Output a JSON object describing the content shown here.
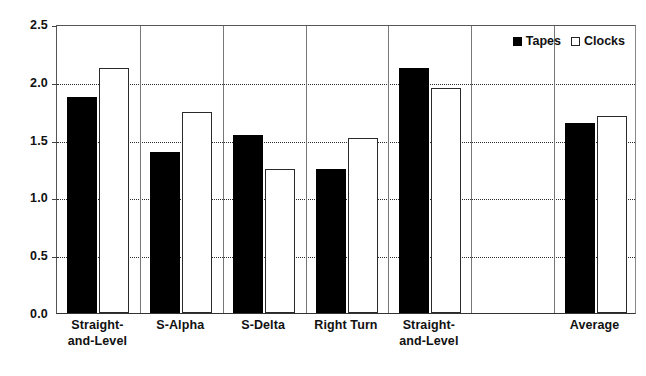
{
  "chart_data": {
    "type": "bar",
    "title": "",
    "subtitle": "",
    "xlabel": "",
    "ylabel": "",
    "ylim": [
      0.0,
      2.5
    ],
    "yticks": [
      "0.0",
      "0.5",
      "1.0",
      "1.5",
      "2.0",
      "2.5"
    ],
    "ytick_values": [
      0.0,
      0.5,
      1.0,
      1.5,
      2.0,
      2.5
    ],
    "grid": "horizontal-dotted",
    "legend_position": "top-right-inside",
    "categories": [
      "Straight-\nand-Level",
      "S-Alpha",
      "S-Delta",
      "Right Turn",
      "Straight-\nand-Level",
      "",
      "Average"
    ],
    "series": [
      {
        "name": "Tapes",
        "color": "#000000",
        "style": "filled",
        "values": [
          1.87,
          1.39,
          1.54,
          1.25,
          2.12,
          null,
          1.64
        ]
      },
      {
        "name": "Clocks",
        "color": "#ffffff",
        "style": "hollow",
        "values": [
          2.12,
          1.74,
          1.25,
          1.51,
          1.95,
          null,
          1.7
        ]
      }
    ]
  },
  "legend": {
    "entries": [
      {
        "label": "Tapes",
        "swatch": "filled-square"
      },
      {
        "label": "Clocks",
        "swatch": "hollow-square"
      }
    ]
  },
  "axes": {
    "y_labels": [
      "2.5",
      "2.0",
      "1.5",
      "1.0",
      "0.5",
      "0.0"
    ],
    "x_labels": [
      "Straight-\nand-Level",
      "S-Alpha",
      "S-Delta",
      "Right Turn",
      "Straight-\nand-Level",
      "",
      "Average"
    ]
  },
  "colors": {
    "tapes": "#000000",
    "clocks": "#ffffff",
    "axis": "#333333",
    "gridline": "#2b2b2b"
  }
}
